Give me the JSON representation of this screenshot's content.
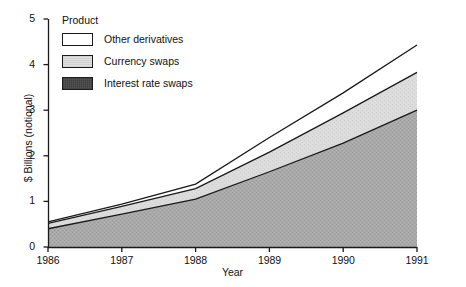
{
  "chart_data": {
    "type": "area",
    "title": "",
    "subtitle": "",
    "xlabel": "Year",
    "ylabel": "$ Billions (notional)",
    "stacked": true,
    "grid": false,
    "legend_position": "top-left",
    "legend_title": "Product",
    "x": [
      1986,
      1987,
      1988,
      1989,
      1990,
      1991
    ],
    "categories": [
      "1986",
      "1987",
      "1988",
      "1989",
      "1990",
      "1991"
    ],
    "xlim": [
      1986,
      1991
    ],
    "ylim": [
      0,
      5
    ],
    "xticks": [
      "1986",
      "1987",
      "1988",
      "1989",
      "1990",
      "1991"
    ],
    "yticks": [
      "0",
      "1",
      "2",
      "3",
      "4",
      "5"
    ],
    "series": [
      {
        "name": "Interest rate swaps",
        "color": "#a9a9a9",
        "values": [
          0.4,
          0.72,
          1.05,
          1.65,
          2.28,
          3.0
        ]
      },
      {
        "name": "Currency swaps",
        "color": "#d9d9d9",
        "values": [
          0.12,
          0.17,
          0.23,
          0.43,
          0.66,
          0.83
        ]
      },
      {
        "name": "Other derivatives",
        "color": "#ffffff",
        "values": [
          0.03,
          0.05,
          0.1,
          0.32,
          0.44,
          0.6
        ]
      }
    ],
    "cumulative_tops": {
      "interest_rate_swaps": [
        0.4,
        0.72,
        1.05,
        1.65,
        2.28,
        3.0
      ],
      "currency_swaps": [
        0.52,
        0.89,
        1.28,
        2.08,
        2.94,
        3.83
      ],
      "other_derivatives": [
        0.55,
        0.94,
        1.38,
        2.4,
        3.38,
        4.43
      ]
    }
  },
  "axes": {
    "y_title": "$ Billions (notional)",
    "x_title": "Year",
    "y_tick_labels": [
      "5",
      "4",
      "3",
      "2",
      "1",
      "0"
    ],
    "x_tick_labels": [
      "1986",
      "1987",
      "1988",
      "1989",
      "1990",
      "1991"
    ]
  },
  "legend": {
    "title": "Product",
    "items": [
      {
        "label": "Other derivatives",
        "swatch": "#ffffff",
        "pattern": "solid-white"
      },
      {
        "label": "Currency swaps",
        "swatch": "#d9d9d9",
        "pattern": "light-stipple"
      },
      {
        "label": "Interest rate swaps",
        "swatch": "#a9a9a9",
        "pattern": "dark-stipple"
      }
    ]
  },
  "colors": {
    "axis": "#1a1a1a",
    "text": "#111111",
    "background": "#ffffff",
    "band_interest_rate_swaps": "#a9a9a9",
    "band_currency_swaps": "#d9d9d9",
    "band_other_derivatives": "#ffffff"
  }
}
